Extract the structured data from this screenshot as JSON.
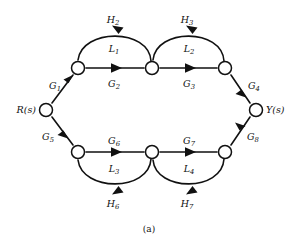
{
  "figure": {
    "caption": "(a)",
    "type": "signal-flow-graph",
    "stroke_color": "#111111",
    "node_fill": "#ffffff",
    "background": "#ffffff"
  },
  "io_nodes": {
    "input_label": "R(s)",
    "output_label": "Y(s)"
  },
  "gains": {
    "g1": "G",
    "g1_sub": "1",
    "g2": "G",
    "g2_sub": "2",
    "g3": "G",
    "g3_sub": "3",
    "g4": "G",
    "g4_sub": "4",
    "g5": "G",
    "g5_sub": "5",
    "g6": "G",
    "g6_sub": "6",
    "g7": "G",
    "g7_sub": "7",
    "g8": "G",
    "g8_sub": "8"
  },
  "feedbacks": {
    "h2": "H",
    "h2_sub": "2",
    "h3": "H",
    "h3_sub": "3",
    "h6": "H",
    "h6_sub": "6",
    "h7": "H",
    "h7_sub": "7"
  },
  "loops": {
    "l1": "L",
    "l1_sub": "1",
    "l2": "L",
    "l2_sub": "2",
    "l3": "L",
    "l3_sub": "3",
    "l4": "L",
    "l4_sub": "4"
  },
  "nodes": [
    {
      "id": "R",
      "label": "R(s)",
      "x": 46,
      "y": 110
    },
    {
      "id": "n1",
      "label": "",
      "x": 78,
      "y": 68
    },
    {
      "id": "n2",
      "label": "",
      "x": 152,
      "y": 68
    },
    {
      "id": "n3",
      "label": "",
      "x": 225,
      "y": 68
    },
    {
      "id": "n5",
      "label": "",
      "x": 78,
      "y": 152
    },
    {
      "id": "n6",
      "label": "",
      "x": 152,
      "y": 152
    },
    {
      "id": "n7",
      "label": "",
      "x": 225,
      "y": 152
    },
    {
      "id": "Y",
      "label": "Y(s)",
      "x": 256,
      "y": 110
    }
  ],
  "edges": [
    {
      "name": "G1",
      "from": "R",
      "to": "n1",
      "kind": "straight"
    },
    {
      "name": "G2",
      "from": "n1",
      "to": "n2",
      "kind": "straight"
    },
    {
      "name": "G3",
      "from": "n2",
      "to": "n3",
      "kind": "straight"
    },
    {
      "name": "G4",
      "from": "n3",
      "to": "Y",
      "kind": "straight"
    },
    {
      "name": "G5",
      "from": "R",
      "to": "n5",
      "kind": "straight"
    },
    {
      "name": "G6",
      "from": "n5",
      "to": "n6",
      "kind": "straight"
    },
    {
      "name": "G7",
      "from": "n6",
      "to": "n7",
      "kind": "straight"
    },
    {
      "name": "G8",
      "from": "n7",
      "to": "Y",
      "kind": "straight"
    },
    {
      "name": "H2",
      "from": "n2",
      "to": "n1",
      "kind": "arc-up"
    },
    {
      "name": "H3",
      "from": "n3",
      "to": "n2",
      "kind": "arc-up"
    },
    {
      "name": "H6",
      "from": "n6",
      "to": "n5",
      "kind": "arc-down"
    },
    {
      "name": "H7",
      "from": "n7",
      "to": "n6",
      "kind": "arc-down"
    }
  ]
}
